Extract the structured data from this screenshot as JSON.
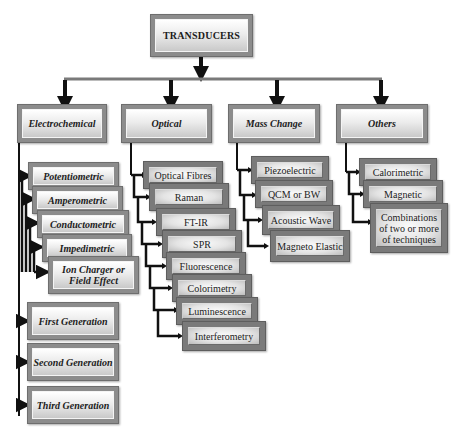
{
  "root": {
    "label": "TRANSDUCERS"
  },
  "categories": [
    {
      "label": "Electrochemical",
      "items": [
        "Potentiometric",
        "Amperometric",
        "Conductometric",
        "Impedimetric",
        "Ion Charger or Field Effect"
      ],
      "generations": [
        "First Generation",
        "Second Generation",
        "Third Generation"
      ]
    },
    {
      "label": "Optical",
      "items": [
        "Optical Fibres",
        "Raman",
        "FT-IR",
        "SPR",
        "Fluorescence",
        "Colorimetry",
        "Luminescence",
        "Interferometry"
      ]
    },
    {
      "label": "Mass Change",
      "items": [
        "Piezoelectric",
        "QCM or BW",
        "Acoustic Wave",
        "Magneto Elastic"
      ]
    },
    {
      "label": "Others",
      "items": [
        "Calorimetric",
        "Magnetic",
        "Combinations of two or more of techniques"
      ]
    }
  ],
  "colors": {
    "box_frame": "#8c8c8c",
    "line": "#111111",
    "text": "#1c1c1c"
  }
}
